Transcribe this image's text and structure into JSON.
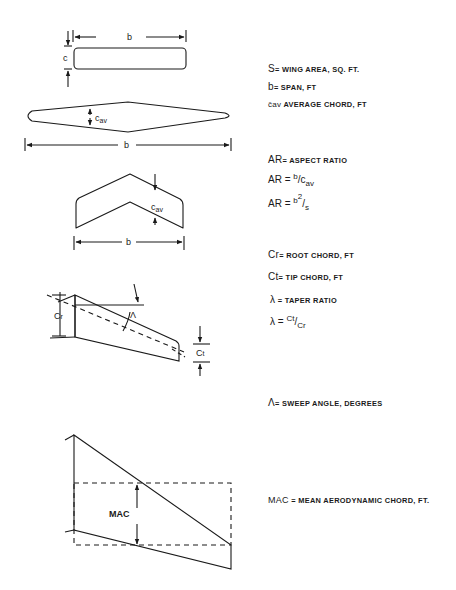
{
  "diagram": {
    "title": "",
    "colors": {
      "ink": "#1a1a1a",
      "background": "#ffffff"
    },
    "figures": [
      {
        "id": "rectangular-wing",
        "labels": {
          "span": "b",
          "chord": "c"
        }
      },
      {
        "id": "diamond-wing",
        "labels": {
          "span": "b",
          "chord": "cav"
        }
      },
      {
        "id": "swept-chevron-wing",
        "labels": {
          "span": "b",
          "chord": "cav"
        }
      },
      {
        "id": "tapered-swept-wing",
        "labels": {
          "root_chord": "Cr",
          "tip_chord": "Ct",
          "sweep": "Λ"
        }
      },
      {
        "id": "mac-wing",
        "labels": {
          "mac": "MAC"
        }
      }
    ],
    "definitions": {
      "s": {
        "symbol": "S",
        "text": "= WING AREA, SQ. FT."
      },
      "b": {
        "symbol": "b",
        "text": "= SPAN, FT"
      },
      "cav": {
        "symbol": "c̄av",
        "text": " AVERAGE CHORD, FT"
      },
      "ar": {
        "symbol": "AR",
        "text": "= ASPECT RATIO"
      },
      "ar_formula1": {
        "lhs": "AR =",
        "num": "b",
        "den": "c",
        "den_sub": "av"
      },
      "ar_formula2": {
        "lhs": "AR =",
        "num": "b",
        "num_sup": "2",
        "den": "s"
      },
      "cr": {
        "symbol": "Cr",
        "text": "= ROOT CHORD, FT"
      },
      "ct": {
        "symbol": "Ct",
        "text": "= TIP CHORD, FT"
      },
      "lambda": {
        "symbol": "λ",
        "text": "= TAPER RATIO"
      },
      "lambda_formula": {
        "lhs": "λ =",
        "num": "Ct",
        "den": "Cr"
      },
      "sweep": {
        "symbol": "Λ",
        "text": "= SWEEP ANGLE, DEGREES"
      },
      "mac": {
        "symbol": "MAC",
        "text": "= MEAN AERODYNAMIC CHORD, FT."
      }
    }
  }
}
